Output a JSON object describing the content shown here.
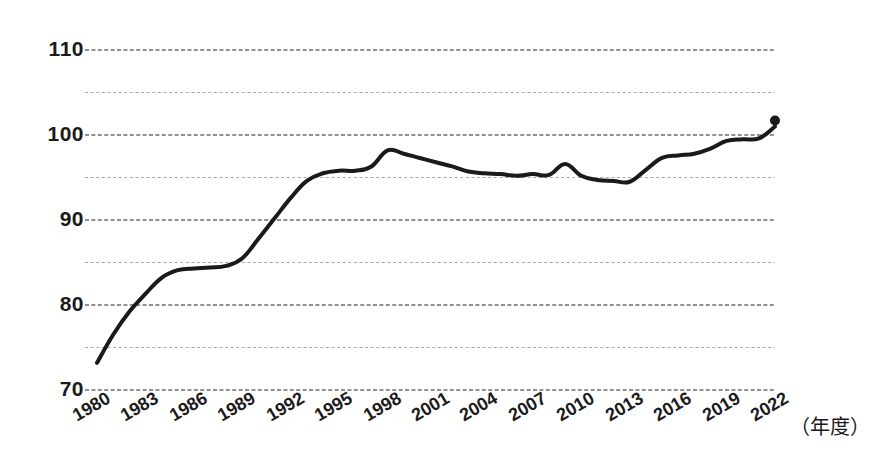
{
  "chart_data": {
    "type": "line",
    "title": "",
    "subtitle": "",
    "xlabel": "（年度）",
    "ylabel": "",
    "xlim": [
      1980,
      2022
    ],
    "ylim": [
      70,
      110
    ],
    "ytick_step": 10,
    "gridline_step": 5,
    "grid": true,
    "grid_style": "dashed-horizontal",
    "legend": "none",
    "line_color": "#1a1a1a",
    "line_width": 4,
    "end_marker": "dot",
    "x": [
      1980,
      1981,
      1982,
      1983,
      1984,
      1985,
      1986,
      1987,
      1988,
      1989,
      1990,
      1991,
      1992,
      1993,
      1994,
      1995,
      1996,
      1997,
      1998,
      1999,
      2000,
      2001,
      2002,
      2003,
      2004,
      2005,
      2006,
      2007,
      2008,
      2009,
      2010,
      2011,
      2012,
      2013,
      2014,
      2015,
      2016,
      2017,
      2018,
      2019,
      2020,
      2021,
      2022
    ],
    "values": [
      73.2,
      76.5,
      79.2,
      81.3,
      83.2,
      84.1,
      84.3,
      84.4,
      84.6,
      85.5,
      87.8,
      90.2,
      92.6,
      94.6,
      95.5,
      95.8,
      95.8,
      96.3,
      98.2,
      97.8,
      97.3,
      96.8,
      96.3,
      95.7,
      95.5,
      95.4,
      95.2,
      95.4,
      95.3,
      96.6,
      95.2,
      94.7,
      94.6,
      94.5,
      95.9,
      97.3,
      97.6,
      97.8,
      98.4,
      99.3,
      99.5,
      99.6,
      101.0
    ],
    "ytick_labels": [
      "110",
      "100",
      "90",
      "80",
      "70"
    ],
    "ytick_values": [
      110,
      100,
      90,
      80,
      70
    ],
    "gridline_values": [
      110,
      105,
      100,
      95,
      90,
      85,
      80,
      75,
      70
    ],
    "xtick_labels": [
      "1980",
      "1983",
      "1986",
      "1989",
      "1992",
      "1995",
      "1998",
      "2001",
      "2004",
      "2007",
      "2010",
      "2013",
      "2016",
      "2019",
      "2022"
    ],
    "xtick_values": [
      1980,
      1983,
      1986,
      1989,
      1992,
      1995,
      1998,
      2001,
      2004,
      2007,
      2010,
      2013,
      2016,
      2019,
      2022
    ]
  }
}
